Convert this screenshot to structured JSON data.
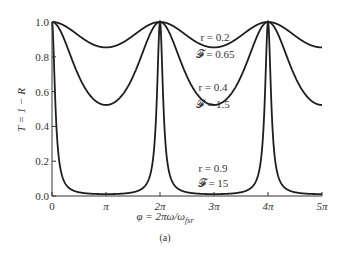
{
  "chart_data": {
    "type": "line",
    "title": "",
    "xlabel": "φ = 2πω/ω_fsr",
    "ylabel": "T = 1 − R",
    "xlim": [
      0,
      5
    ],
    "x_units": "π",
    "ylim": [
      0.0,
      1.0
    ],
    "grid": false,
    "x_ticks": [
      "0",
      "π",
      "2π",
      "3π",
      "4π",
      "5π"
    ],
    "y_ticks": [
      "0.0",
      "0.2",
      "0.4",
      "0.6",
      "0.8",
      "1.0"
    ],
    "series": [
      {
        "name": "r = 0.2, 𝓕 = 0.65",
        "r": 0.2,
        "F": 0.65,
        "min_T": 0.85,
        "peaks_at": [
          0,
          2,
          4
        ]
      },
      {
        "name": "r = 0.4, 𝓕 = 1.5",
        "r": 0.4,
        "F": 1.5,
        "min_T": 0.52,
        "peaks_at": [
          0,
          2,
          4
        ]
      },
      {
        "name": "r = 0.9, 𝓕 = 15",
        "r": 0.9,
        "F": 15,
        "min_T": 0.01,
        "peaks_at": [
          0,
          2,
          4
        ]
      }
    ],
    "annotations": [
      {
        "text": "r = 0.2",
        "line2": "𝓕 = 0.65"
      },
      {
        "text": "r = 0.4",
        "line2": "𝓕 = 1.5"
      },
      {
        "text": "r = 0.9",
        "line2": "𝓕 = 15"
      }
    ],
    "caption": "(a)"
  },
  "labels": {
    "ylabel": "T = 1 − R",
    "xlabel": "φ = 2πω/ω",
    "xlabel_sub": "fsr",
    "caption": "(a)",
    "ann": [
      {
        "a": "r = 0.2",
        "b": "𝓕 = 0.65"
      },
      {
        "a": "r = 0.4",
        "b": "𝓕 = 1.5"
      },
      {
        "a": "r = 0.9",
        "b": "𝓕 = 15"
      }
    ],
    "xticks": [
      "0",
      "π",
      "2π",
      "3π",
      "4π",
      "5π"
    ],
    "yticks": [
      "0.0",
      "0.2",
      "0.4",
      "0.6",
      "0.8",
      "1.0"
    ]
  }
}
